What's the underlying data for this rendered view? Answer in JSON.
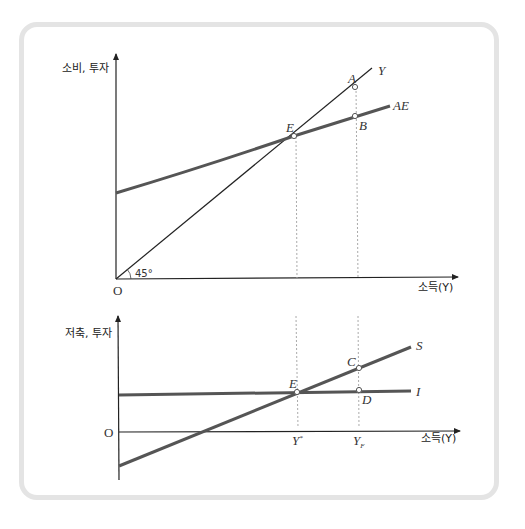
{
  "diagram": {
    "type": "keynesian-cross",
    "top_panel": {
      "y_axis_label": "소비, 투자",
      "x_axis_label": "소득(Y)",
      "origin_label": "O",
      "angle_label": "45°",
      "lines": [
        {
          "name": "Y",
          "label": "Y",
          "description": "45-degree line"
        },
        {
          "name": "AE",
          "label": "AE",
          "description": "aggregate expenditure"
        }
      ],
      "points": [
        {
          "label": "A",
          "on": "Y"
        },
        {
          "label": "B",
          "on": "AE"
        },
        {
          "label": "E",
          "on": "intersection Y & AE"
        }
      ]
    },
    "bottom_panel": {
      "y_axis_label": "저축, 투자",
      "x_axis_label": "소득(Y)",
      "origin_label": "O",
      "lines": [
        {
          "name": "S",
          "label": "S",
          "description": "saving"
        },
        {
          "name": "I",
          "label": "I",
          "description": "investment"
        }
      ],
      "points": [
        {
          "label": "C",
          "on": "S"
        },
        {
          "label": "D",
          "on": "I"
        },
        {
          "label": "E",
          "on": "intersection S & I"
        }
      ],
      "x_ticks": [
        {
          "label": "Y",
          "sup": "*"
        },
        {
          "label": "Y",
          "sub": "F"
        }
      ]
    }
  },
  "colors": {
    "frame": "#e4e4e4",
    "thick_line": "#555555",
    "thin_line": "#222222",
    "dashed": "#aaaaaa"
  }
}
